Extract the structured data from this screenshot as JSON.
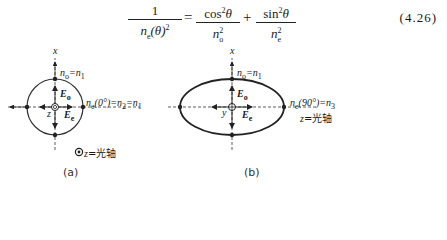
{
  "equation": {
    "number": "(4.26)",
    "lhs_num": "1",
    "lhs_den": "n",
    "lhs_den_sub": "e",
    "lhs_den_arg": "(θ)",
    "lhs_den_sup": "2",
    "equals": "=",
    "term1_num": "cos",
    "term1_num_sup": "2",
    "term1_num_var": "θ",
    "term1_den": "n",
    "term1_den_sup": "2",
    "term1_den_sub": "o",
    "plus": "+",
    "term2_num": "sin",
    "term2_num_sup": "2",
    "term2_num_var": "θ",
    "term2_den": "n",
    "term2_den_sup": "2",
    "term2_den_sub": "e"
  },
  "figure_a": {
    "x_axis": "x",
    "z_label": "z",
    "top_label": "n",
    "top_label_sub": "o",
    "top_label_rhs": "=n",
    "top_label_rhs_sub": "1",
    "eo": "E",
    "eo_sub": "o",
    "ee": "E",
    "ee_sub": "e",
    "right_label": "n",
    "right_label_sub": "e",
    "right_label_arg": "(0°)=n",
    "right_label_sub2": "2",
    "right_label_rhs": "=n",
    "right_label_sub3": "1",
    "legend_var": "z",
    "legend_text": "=光轴",
    "caption": "(a)"
  },
  "figure_b": {
    "x_axis": "x",
    "y_label": "y",
    "top_label": "n",
    "top_label_sub": "o",
    "top_label_rhs": "=n",
    "top_label_rhs_sub": "1",
    "eo": "E",
    "eo_sub": "o",
    "ee": "E",
    "ee_sub": "e",
    "right_label": "n",
    "right_label_sub": "e",
    "right_label_arg": "(90°)=n",
    "right_label_sub2": "3",
    "axis_var": "z",
    "axis_text": "=光轴",
    "caption": "(b)"
  }
}
